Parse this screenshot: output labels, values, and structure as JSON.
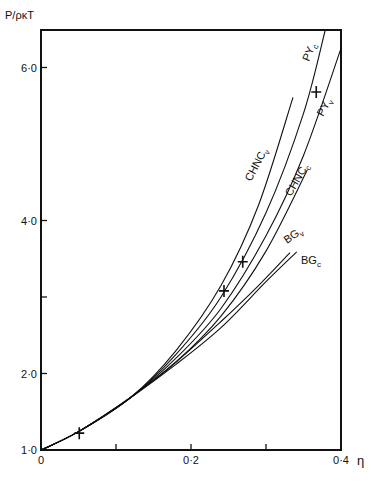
{
  "chart_data": {
    "type": "line",
    "title": "",
    "xlabel": "η",
    "ylabel": "P/ρκT",
    "xlim": [
      0,
      0.4
    ],
    "ylim": [
      1.0,
      6.5
    ],
    "grid": false,
    "x_ticks": [
      {
        "value": 0,
        "label": "0"
      },
      {
        "value": 0.1,
        "label": ""
      },
      {
        "value": 0.2,
        "label": "0·2"
      },
      {
        "value": 0.3,
        "label": ""
      },
      {
        "value": 0.4,
        "label": "0·4"
      }
    ],
    "y_ticks": [
      {
        "value": 1.0,
        "label": "1·0"
      },
      {
        "value": 2.0,
        "label": "2·0"
      },
      {
        "value": 3.0,
        "label": ""
      },
      {
        "value": 4.0,
        "label": "4·0"
      },
      {
        "value": 6.0,
        "label": "6·0"
      }
    ],
    "series": [
      {
        "name": "CHNCv",
        "label_main": "CHNC",
        "label_sub": "v",
        "x": [
          0,
          0.05,
          0.12,
          0.18,
          0.24,
          0.29,
          0.336
        ],
        "y": [
          1.0,
          1.24,
          1.69,
          2.3,
          3.15,
          4.2,
          5.61
        ]
      },
      {
        "name": "PYc",
        "label_main": "PY",
        "label_sub": "c",
        "x": [
          0,
          0.05,
          0.12,
          0.18,
          0.24,
          0.3,
          0.35,
          0.379
        ],
        "y": [
          1.0,
          1.24,
          1.69,
          2.25,
          3.0,
          4.1,
          5.4,
          6.49
        ]
      },
      {
        "name": "PYv",
        "label_main": "PY",
        "label_sub": "v",
        "x": [
          0,
          0.05,
          0.12,
          0.18,
          0.24,
          0.3,
          0.35,
          0.4
        ],
        "y": [
          1.0,
          1.24,
          1.69,
          2.2,
          2.85,
          3.8,
          4.85,
          6.25
        ]
      },
      {
        "name": "CHNCc",
        "label_main": "CHNC",
        "label_sub": "c",
        "x": [
          0,
          0.05,
          0.12,
          0.18,
          0.24,
          0.3,
          0.355
        ],
        "y": [
          1.0,
          1.24,
          1.69,
          2.15,
          2.75,
          3.6,
          4.66
        ]
      },
      {
        "name": "BGv",
        "label_main": "BG",
        "label_sub": "v",
        "x": [
          0,
          0.05,
          0.12,
          0.18,
          0.24,
          0.29,
          0.332
        ],
        "y": [
          1.0,
          1.24,
          1.69,
          2.15,
          2.68,
          3.15,
          3.58
        ]
      },
      {
        "name": "BGc",
        "label_main": "BG",
        "label_sub": "c",
        "x": [
          0,
          0.05,
          0.12,
          0.18,
          0.24,
          0.3,
          0.341
        ],
        "y": [
          1.0,
          1.24,
          1.69,
          2.12,
          2.6,
          3.2,
          3.59
        ]
      }
    ],
    "markers": {
      "name": "simulation",
      "symbol": "+",
      "x": [
        0.051,
        0.244,
        0.269,
        0.367
      ],
      "y": [
        1.22,
        3.08,
        3.46,
        5.68
      ]
    }
  }
}
